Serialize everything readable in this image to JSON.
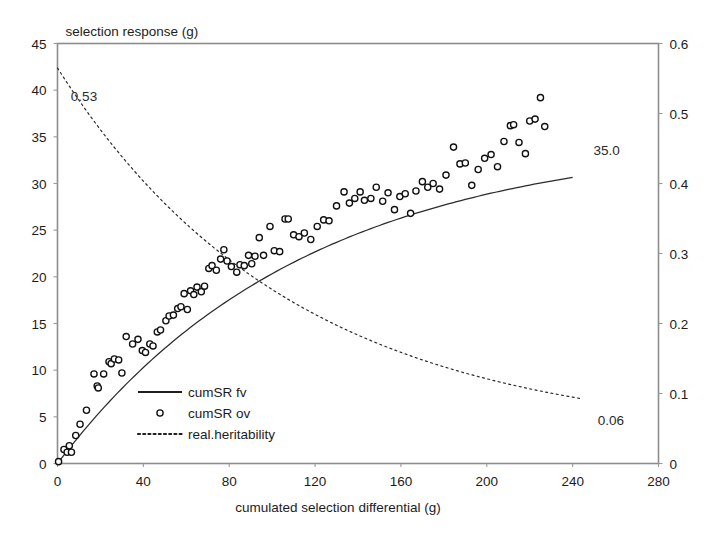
{
  "chart_data": {
    "type": "scatter",
    "title": "",
    "xlabel": "cumulated selection differential (g)",
    "ylabel": "selection response (g)",
    "ylabel_right": "",
    "xlim": [
      0,
      280
    ],
    "ylim": [
      0,
      45
    ],
    "ylim_right": [
      0,
      0.6
    ],
    "xticks": [
      "0",
      "40",
      "80",
      "120",
      "160",
      "200",
      "240",
      "280"
    ],
    "xtick_values": [
      0,
      40,
      80,
      120,
      160,
      200,
      240,
      280
    ],
    "yticks": [
      "0",
      "5",
      "10",
      "15",
      "20",
      "25",
      "30",
      "35",
      "40",
      "45"
    ],
    "ytick_values": [
      0,
      5,
      10,
      15,
      20,
      25,
      30,
      35,
      40,
      45
    ],
    "yticks_right": [
      "0",
      "0.1",
      "0.2",
      "0.3",
      "0.4",
      "0.5",
      "0.6"
    ],
    "ytick_values_right": [
      0,
      0.1,
      0.2,
      0.3,
      0.4,
      0.5,
      0.6
    ],
    "grid": false,
    "legend_position": "lower-left-inside",
    "annotations": [
      {
        "text": "0.53",
        "x": 2.5,
        "y_right": 0.525,
        "axis": "right"
      },
      {
        "text": "35.0",
        "x": 246,
        "y": 33.6,
        "axis": "left"
      },
      {
        "text": "0.06",
        "x": 248,
        "y_right": 0.062,
        "axis": "right"
      }
    ],
    "series": [
      {
        "name": "cumSR fv",
        "type": "line",
        "axis": "left",
        "style": "solid",
        "model": "asymptotic: y = 35.0 * (1 - exp(-x/115))",
        "x": [
          0,
          10,
          20,
          30,
          40,
          50,
          60,
          70,
          80,
          90,
          100,
          110,
          120,
          130,
          140,
          150,
          160,
          170,
          180,
          190,
          200,
          210,
          220,
          230,
          240
        ],
        "y": [
          0.0,
          2.9,
          5.6,
          8.1,
          10.4,
          12.5,
          14.5,
          16.3,
          18.0,
          19.6,
          21.0,
          22.4,
          23.6,
          24.8,
          25.8,
          26.8,
          27.7,
          28.5,
          29.3,
          30.0,
          30.7,
          31.3,
          31.8,
          32.4,
          32.8
        ]
      },
      {
        "name": "real.heritability",
        "type": "line",
        "axis": "right",
        "style": "dotted",
        "model": "decay: h2 = 0.53 * exp(-x/110) + 0.035",
        "x": [
          0,
          10,
          20,
          30,
          40,
          50,
          60,
          70,
          80,
          90,
          100,
          110,
          120,
          130,
          140,
          150,
          160,
          170,
          180,
          190,
          200,
          210,
          220,
          230,
          240
        ],
        "y": [
          0.53,
          0.487,
          0.447,
          0.411,
          0.378,
          0.348,
          0.321,
          0.296,
          0.274,
          0.253,
          0.235,
          0.218,
          0.202,
          0.188,
          0.176,
          0.164,
          0.154,
          0.144,
          0.135,
          0.128,
          0.121,
          0.114,
          0.108,
          0.103,
          0.098
        ]
      },
      {
        "name": "cumSR ov",
        "type": "scatter",
        "axis": "left",
        "marker": "open-circle",
        "points": [
          [
            0.5,
            0.2
          ],
          [
            3.0,
            1.5
          ],
          [
            4.5,
            1.2
          ],
          [
            5.5,
            1.9
          ],
          [
            6.5,
            1.2
          ],
          [
            8.5,
            3.0
          ],
          [
            10.5,
            4.2
          ],
          [
            13.5,
            5.7
          ],
          [
            17.0,
            9.6
          ],
          [
            18.5,
            8.3
          ],
          [
            19.0,
            8.1
          ],
          [
            21.5,
            9.6
          ],
          [
            24.0,
            10.9
          ],
          [
            25.0,
            10.7
          ],
          [
            26.5,
            11.2
          ],
          [
            28.5,
            11.1
          ],
          [
            30.0,
            9.7
          ],
          [
            32.0,
            13.6
          ],
          [
            35.0,
            12.8
          ],
          [
            37.5,
            13.3
          ],
          [
            39.5,
            12.1
          ],
          [
            41.0,
            11.9
          ],
          [
            43.0,
            12.8
          ],
          [
            44.5,
            12.6
          ],
          [
            46.5,
            14.1
          ],
          [
            48.0,
            14.3
          ],
          [
            50.5,
            15.3
          ],
          [
            52.0,
            15.8
          ],
          [
            54.0,
            15.9
          ],
          [
            56.0,
            16.6
          ],
          [
            57.5,
            16.8
          ],
          [
            59.0,
            18.2
          ],
          [
            60.5,
            16.5
          ],
          [
            62.0,
            18.5
          ],
          [
            63.5,
            18.1
          ],
          [
            65.0,
            18.9
          ],
          [
            67.0,
            18.4
          ],
          [
            68.5,
            19.0
          ],
          [
            70.5,
            20.9
          ],
          [
            72.0,
            21.2
          ],
          [
            74.0,
            20.7
          ],
          [
            76.0,
            21.9
          ],
          [
            77.5,
            22.9
          ],
          [
            79.0,
            21.7
          ],
          [
            81.0,
            21.1
          ],
          [
            83.5,
            20.5
          ],
          [
            85.0,
            21.3
          ],
          [
            87.0,
            21.2
          ],
          [
            89.0,
            22.3
          ],
          [
            90.5,
            21.4
          ],
          [
            92.0,
            22.2
          ],
          [
            94.0,
            24.2
          ],
          [
            96.0,
            22.3
          ],
          [
            99.0,
            25.4
          ],
          [
            101.0,
            22.8
          ],
          [
            103.5,
            22.7
          ],
          [
            106.0,
            26.2
          ],
          [
            107.5,
            26.2
          ],
          [
            110.0,
            24.5
          ],
          [
            112.5,
            24.3
          ],
          [
            115.0,
            24.7
          ],
          [
            118.0,
            24.0
          ],
          [
            121.0,
            25.4
          ],
          [
            124.0,
            26.1
          ],
          [
            126.5,
            26.0
          ],
          [
            130.0,
            27.6
          ],
          [
            133.5,
            29.1
          ],
          [
            136.0,
            27.9
          ],
          [
            138.5,
            28.4
          ],
          [
            141.0,
            29.1
          ],
          [
            143.0,
            28.2
          ],
          [
            146.0,
            28.4
          ],
          [
            148.5,
            29.6
          ],
          [
            151.5,
            28.1
          ],
          [
            154.0,
            29.0
          ],
          [
            157.0,
            27.2
          ],
          [
            159.5,
            28.6
          ],
          [
            162.0,
            28.9
          ],
          [
            164.5,
            26.8
          ],
          [
            167.0,
            29.2
          ],
          [
            170.0,
            30.2
          ],
          [
            172.5,
            29.6
          ],
          [
            175.0,
            30.0
          ],
          [
            178.0,
            29.4
          ],
          [
            181.0,
            30.9
          ],
          [
            184.5,
            33.9
          ],
          [
            187.5,
            32.1
          ],
          [
            190.0,
            32.2
          ],
          [
            193.0,
            29.8
          ],
          [
            196.0,
            31.5
          ],
          [
            199.0,
            32.7
          ],
          [
            202.0,
            33.1
          ],
          [
            205.0,
            31.8
          ],
          [
            208.0,
            34.5
          ],
          [
            211.0,
            36.2
          ],
          [
            212.5,
            36.3
          ],
          [
            215.0,
            34.4
          ],
          [
            218.0,
            33.2
          ],
          [
            220.0,
            36.7
          ],
          [
            222.5,
            36.9
          ],
          [
            225.0,
            39.2
          ],
          [
            227.0,
            36.1
          ]
        ]
      }
    ]
  },
  "legend": {
    "items": [
      {
        "label": "cumSR fv",
        "marker": "solid-line"
      },
      {
        "label": "cumSR ov",
        "marker": "open-circle"
      },
      {
        "label": "real.heritability",
        "marker": "dotted-line"
      }
    ]
  },
  "colors": {
    "line": "#2b2b2b",
    "marker_stroke": "#101010",
    "marker_fill": "#ffffff",
    "frame": "#8d8d8d",
    "text": "#1c1c1c",
    "background": "#ffffff"
  }
}
